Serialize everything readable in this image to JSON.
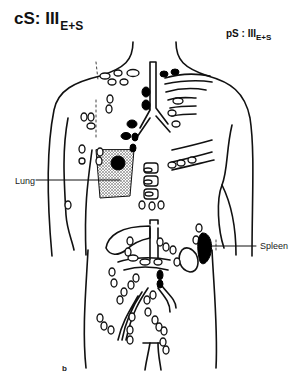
{
  "titles": {
    "clinical_stage": {
      "prefix": "cS: III",
      "subscript": "E+S"
    },
    "pathological_stage": {
      "prefix": "pS : III",
      "subscript": "E+S"
    }
  },
  "labels": {
    "lung": "Lung",
    "spleen": "Spleen",
    "panel": "b"
  },
  "legend_semantics": {
    "filled_node": "involved lymph node",
    "open_node": "uninvolved lymph node",
    "stippled_region": "lung involvement"
  },
  "colors": {
    "line": "#111111",
    "background": "#ffffff",
    "involved": "#000000"
  }
}
